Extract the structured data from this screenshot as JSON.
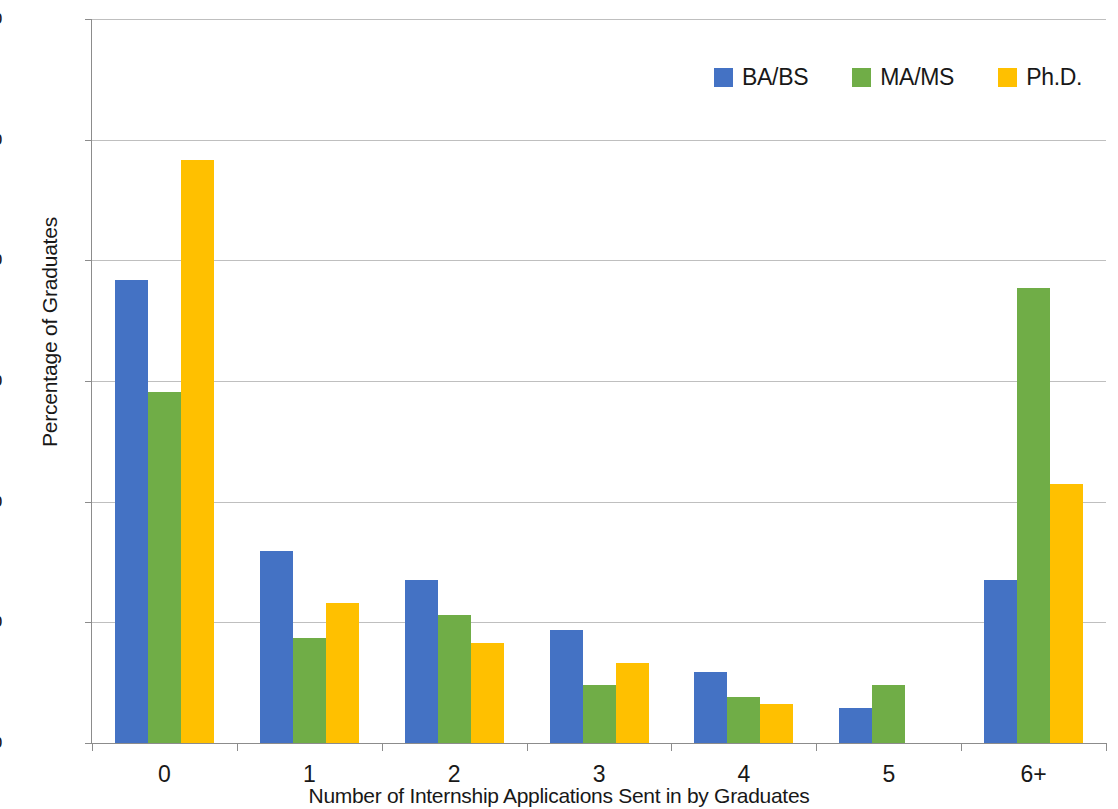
{
  "chart_data": {
    "type": "bar",
    "title": "",
    "xlabel": "Number of Internship Applications Sent in by Graduates",
    "ylabel": "Percentage of Graduates",
    "categories": [
      "0",
      "1",
      "2",
      "3",
      "4",
      "5",
      "6+"
    ],
    "series": [
      {
        "name": "BA/BS",
        "color": "#4472c4",
        "values": [
          38.4,
          15.9,
          13.5,
          9.4,
          5.9,
          2.9,
          13.5
        ]
      },
      {
        "name": "MA/MS",
        "color": "#70ad47",
        "values": [
          29.1,
          8.7,
          10.6,
          4.8,
          3.8,
          4.8,
          37.7
        ]
      },
      {
        "name": "Ph.D.",
        "color": "#ffc000",
        "values": [
          48.3,
          11.6,
          8.3,
          6.6,
          3.2,
          0,
          21.5
        ]
      }
    ],
    "ylim": [
      0,
      60
    ],
    "ytick_values": [
      0,
      10,
      20,
      30,
      40,
      50,
      60
    ],
    "ytick_labels": [
      "0%",
      "10%",
      "20%",
      "30%",
      "40%",
      "50%",
      "60%"
    ],
    "grid": true,
    "legend_position": "top-right",
    "axis_color": "#8c8c8c",
    "grid_color": "#bfbfbf",
    "background": "#ffffff"
  }
}
